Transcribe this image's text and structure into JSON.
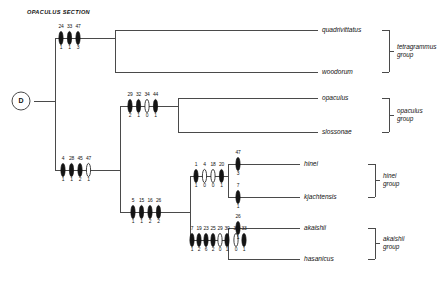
{
  "title": "OPACULUS SECTION",
  "root": {
    "label": "D"
  },
  "taxa": [
    {
      "name": "quadrivittatus"
    },
    {
      "name": "woodorum"
    },
    {
      "name": "opaculus"
    },
    {
      "name": "slossonae"
    },
    {
      "name": "hinei"
    },
    {
      "name": "kjachtensis"
    },
    {
      "name": "akaishii"
    },
    {
      "name": "hasanicus"
    }
  ],
  "groups": [
    {
      "name": "tetragrammus",
      "suffix": "group"
    },
    {
      "name": "opaculus",
      "suffix": "group"
    },
    {
      "name": "hinei",
      "suffix": "group"
    },
    {
      "name": "akaishii",
      "suffix": "group"
    }
  ],
  "branch_characters": {
    "tetragrammus_node": {
      "numbers": [
        "24",
        "33",
        "47"
      ],
      "values": [
        "1",
        "1",
        "3"
      ],
      "filled": [
        true,
        true,
        true
      ]
    },
    "opaculus_node": {
      "numbers": [
        "29",
        "32",
        "34",
        "44"
      ],
      "values": [
        "2",
        "1",
        "0",
        "1"
      ],
      "filled": [
        true,
        true,
        false,
        true
      ]
    },
    "lower_clade_node": {
      "numbers": [
        "4",
        "28",
        "45",
        "47"
      ],
      "values": [
        "1",
        "1",
        "2",
        "1"
      ],
      "filled": [
        true,
        true,
        true,
        false
      ]
    },
    "hinei_akaishii_node": {
      "numbers": [
        "5",
        "15",
        "16",
        "26"
      ],
      "values": [
        "1",
        "1",
        "2",
        "2"
      ],
      "filled": [
        true,
        true,
        true,
        true
      ]
    },
    "hinei_node": {
      "numbers": [
        "1",
        "4",
        "18",
        "20"
      ],
      "values": [
        "1",
        "0",
        "0",
        "1"
      ],
      "filled": [
        true,
        false,
        false,
        true
      ]
    },
    "akaishii_node": {
      "numbers": [
        "7",
        "19",
        "23",
        "25",
        "29",
        "30",
        "31",
        "33"
      ],
      "values": [
        "1",
        "2",
        "6",
        "2",
        "0",
        "1",
        "0",
        "1"
      ],
      "filled": [
        true,
        true,
        true,
        true,
        false,
        true,
        false,
        true
      ]
    },
    "hinei_terminal": {
      "numbers": [
        "47"
      ],
      "values": [
        "3"
      ],
      "filled": [
        true
      ]
    },
    "kjachtensis_terminal": {
      "numbers": [
        "7"
      ],
      "values": [
        "1"
      ],
      "filled": [
        true
      ]
    },
    "akaishii_terminal": {
      "numbers": [
        "26"
      ],
      "values": [
        "1"
      ],
      "filled": [
        true
      ]
    }
  },
  "colors": {
    "line": "#4a4a4a",
    "mark_fill": "#141414",
    "text": "#111111",
    "background": "#ffffff"
  }
}
